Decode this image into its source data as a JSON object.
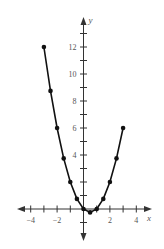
{
  "chart_data": {
    "type": "line",
    "title": "",
    "xlabel": "x",
    "ylabel": "y",
    "xlim": [
      -5,
      5
    ],
    "ylim": [
      -2,
      14
    ],
    "grid": false,
    "legend": null,
    "x_ticks": [
      -4,
      -3,
      -2,
      -1,
      1,
      2,
      3,
      4
    ],
    "x_tick_labels": [
      -4,
      -2,
      2,
      4
    ],
    "y_ticks": [
      -1,
      1,
      2,
      3,
      4,
      5,
      6,
      7,
      8,
      9,
      10,
      11,
      12,
      13
    ],
    "y_tick_labels": [
      4,
      6,
      8,
      10,
      12
    ],
    "series": [
      {
        "name": "y = x^2 - x",
        "markers": true,
        "x": [
          -3,
          -2.5,
          -2,
          -1.5,
          -1,
          -0.5,
          0,
          0.5,
          1,
          1.5,
          2,
          2.5,
          3
        ],
        "values": [
          12,
          8.75,
          6,
          3.75,
          2,
          0.75,
          0,
          -0.25,
          0,
          0.75,
          2,
          3.75,
          6
        ]
      }
    ]
  },
  "style": {
    "line_color": "#111111",
    "axis_color": "#333333",
    "text_color": "#555555"
  },
  "layout": {
    "origin_px": [
      83.5,
      209
    ],
    "x_scale": 13.2,
    "y_scale": 13.5,
    "x_axis_extent_px": [
      17,
      152
    ],
    "y_axis_extent_px": [
      17,
      241
    ]
  }
}
